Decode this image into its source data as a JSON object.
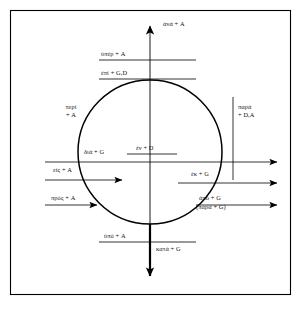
{
  "figure": {
    "frame_color": "#000000",
    "background_color": "#ffffff",
    "line_color": "#000000",
    "text_color": "#111111"
  },
  "legend_note": {
    "case_abbreviations": [
      "A",
      "G",
      "D"
    ]
  },
  "labels": {
    "ana": "ἀνά + A",
    "hyper": "ὑπέρ + A",
    "epi": "ἐπί + G,D",
    "peri_line1": "περί",
    "peri_line2": "+ A",
    "para_line1": "παρά",
    "para_line2": "+ D,A",
    "dia": "διά + G",
    "en": "ἐν + D",
    "eis": "εἰς + A",
    "pros": "πρός + A",
    "ek": "ἐκ + G",
    "apo": "ἀπό + G",
    "para_paren": "(παρά + G)",
    "hypo": "ὑπό + A",
    "kata": "κατά + G"
  },
  "geometry": {
    "circle_center_x": 150,
    "circle_center_y": 152,
    "circle_radius": 72,
    "frame_x": 10,
    "frame_y": 10,
    "frame_w": 281,
    "frame_h": 285
  }
}
